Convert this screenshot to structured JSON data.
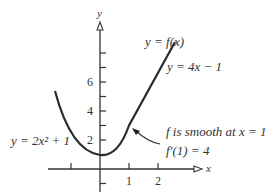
{
  "diagram": {
    "axes": {
      "x_label": "x",
      "y_label": "y"
    },
    "x_ticks": [
      {
        "value": -1,
        "label": ""
      },
      {
        "value": 1,
        "label": "1"
      },
      {
        "value": 2,
        "label": "2"
      }
    ],
    "y_ticks": [
      {
        "value": -1,
        "label": ""
      },
      {
        "value": 1,
        "label": ""
      },
      {
        "value": 2,
        "label": "2"
      },
      {
        "value": 3,
        "label": ""
      },
      {
        "value": 4,
        "label": "4"
      },
      {
        "value": 5,
        "label": ""
      },
      {
        "value": 6,
        "label": "6"
      },
      {
        "value": 7,
        "label": ""
      },
      {
        "value": 8,
        "label": ""
      }
    ],
    "labels": {
      "curve": "y = f(x)",
      "line": "y = 4x − 1",
      "parabola": "y = 2x² + 1",
      "annotation_line1": "f is smooth at x = 1",
      "annotation_line2": "f′(1) = 4"
    },
    "colors": {
      "curve": "#2a2a2a",
      "text": "#333333"
    }
  }
}
